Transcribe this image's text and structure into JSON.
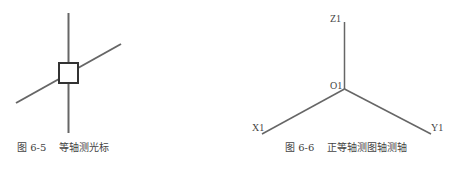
{
  "figures": [
    {
      "id": "fig-6-5",
      "number": "图 6-5",
      "title": "等轴测光标",
      "caption": "图 6-5    等轴测光标",
      "description": "Isometric cursor: vertical line and inclined line crossing through a small square pickbox"
    },
    {
      "id": "fig-6-6",
      "number": "图 6-6",
      "title": "正等轴测图轴测轴",
      "caption": "图 6-6    正等轴测图轴测轴",
      "labels": {
        "z": "Z1",
        "origin": "O1",
        "x": "X1",
        "y": "Y1"
      },
      "description": "Isometric axes: Z1 vertical up from O1, X1 to lower-left, Y1 to lower-right"
    }
  ],
  "colors": {
    "line": "#666666",
    "text": "#444444",
    "square": "#333333"
  }
}
